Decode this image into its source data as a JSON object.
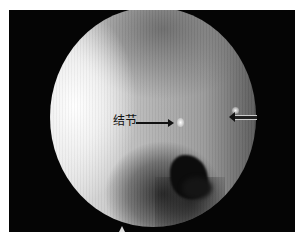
{
  "image": {
    "type": "endoscopic view",
    "annotations": [
      {
        "label": "结节",
        "arrow": "points right to bright nodule at center"
      },
      {
        "label": "",
        "arrow": "points left to small bright spot at right"
      }
    ]
  },
  "labels": {
    "nodule": "结节"
  }
}
